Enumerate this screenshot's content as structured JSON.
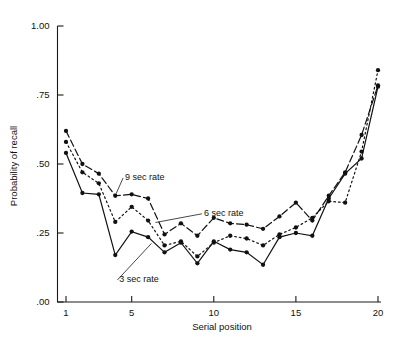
{
  "figure": {
    "background_color": "#ffffff",
    "ink_color": "#111111"
  },
  "chart_data": {
    "type": "line",
    "title": "",
    "xlabel": "Serial position",
    "ylabel": "Probability of recall",
    "xlim": [
      1,
      20
    ],
    "ylim": [
      0.0,
      1.0
    ],
    "grid": false,
    "legend": "inline-annotations",
    "x": [
      1,
      2,
      3,
      4,
      5,
      6,
      7,
      8,
      9,
      10,
      11,
      12,
      13,
      14,
      15,
      16,
      17,
      18,
      19,
      20
    ],
    "xticks": [
      1,
      5,
      10,
      15,
      20
    ],
    "xtick_labels": [
      "1",
      "5",
      "10",
      "15",
      "20"
    ],
    "yticks": [
      0.0,
      0.25,
      0.5,
      0.75,
      1.0
    ],
    "ytick_labels": [
      ".00",
      ".25",
      ".50",
      ".75",
      "1.00"
    ],
    "series": [
      {
        "name": "9 sec rate",
        "label": "9 sec rate",
        "style": "dashed",
        "marker": "filled-circle",
        "values": [
          0.62,
          0.5,
          0.465,
          0.385,
          0.39,
          0.375,
          0.245,
          0.285,
          0.24,
          0.305,
          0.285,
          0.28,
          0.265,
          0.31,
          0.36,
          0.295,
          0.385,
          0.47,
          0.605,
          0.785
        ],
        "label_anchor": {
          "x": 4.6,
          "y": 0.455
        },
        "leader_to": {
          "x": 4.05,
          "y": 0.392
        }
      },
      {
        "name": "6 sec rate",
        "label": "6 sec rate",
        "style": "dotted",
        "marker": "filled-circle",
        "values": [
          0.58,
          0.47,
          0.43,
          0.29,
          0.345,
          0.295,
          0.205,
          0.22,
          0.165,
          0.215,
          0.24,
          0.23,
          0.205,
          0.245,
          0.27,
          0.305,
          0.365,
          0.36,
          0.545,
          0.84
        ],
        "label_anchor": {
          "x": 9.4,
          "y": 0.325
        },
        "leader_to": {
          "x": 6.45,
          "y": 0.288
        }
      },
      {
        "name": "3 sec rate",
        "label": "3 sec rate",
        "style": "solid",
        "marker": "filled-circle",
        "values": [
          0.54,
          0.395,
          0.39,
          0.17,
          0.255,
          0.235,
          0.18,
          0.215,
          0.14,
          0.22,
          0.19,
          0.18,
          0.135,
          0.235,
          0.25,
          0.24,
          0.375,
          0.465,
          0.52,
          0.78
        ],
        "label_anchor": {
          "x": 4.25,
          "y": 0.085
        },
        "leader_to": {
          "x": 6.2,
          "y": 0.212
        }
      }
    ]
  }
}
